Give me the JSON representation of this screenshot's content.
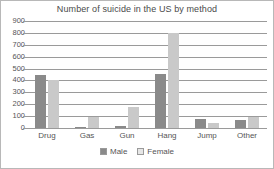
{
  "chart_data": {
    "type": "bar",
    "title": "Number of suicide in the US by method",
    "xlabel": "",
    "ylabel": "",
    "categories": [
      "Drug",
      "Gas",
      "Gun",
      "Hang",
      "Jump",
      "Other"
    ],
    "series": [
      {
        "name": "Male",
        "color": "#8a8a8a",
        "values": [
          450,
          10,
          20,
          455,
          80,
          65
        ]
      },
      {
        "name": "Female",
        "color": "#c9c9c9",
        "values": [
          400,
          90,
          175,
          800,
          45,
          90
        ]
      }
    ],
    "ylim": [
      0,
      900
    ],
    "yticks": [
      0,
      100,
      200,
      300,
      400,
      500,
      600,
      700,
      800,
      900
    ],
    "ytick_labels": [
      "0",
      "100",
      "200",
      "300",
      "400",
      "500",
      "600",
      "700",
      "800",
      "900"
    ],
    "grid": true,
    "legend_position": "bottom"
  }
}
